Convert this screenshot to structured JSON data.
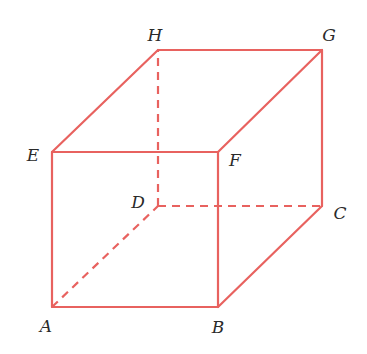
{
  "figure": {
    "type": "cube-wireframe",
    "edge_color": "#e8625f",
    "label_color": "#2a2a2a",
    "vertices": {
      "A": {
        "label": "A",
        "x": 52,
        "y": 307,
        "label_x": 46,
        "label_y": 326
      },
      "B": {
        "label": "B",
        "x": 218,
        "y": 307,
        "label_x": 218,
        "label_y": 327
      },
      "C": {
        "label": "C",
        "x": 322,
        "y": 206,
        "label_x": 340,
        "label_y": 213
      },
      "D": {
        "label": "D",
        "x": 158,
        "y": 206,
        "label_x": 138,
        "label_y": 202
      },
      "E": {
        "label": "E",
        "x": 52,
        "y": 152,
        "label_x": 33,
        "label_y": 155
      },
      "F": {
        "label": "F",
        "x": 218,
        "y": 152,
        "label_x": 235,
        "label_y": 160
      },
      "G": {
        "label": "G",
        "x": 322,
        "y": 50,
        "label_x": 329,
        "label_y": 35
      },
      "H": {
        "label": "H",
        "x": 158,
        "y": 50,
        "label_x": 155,
        "label_y": 35
      }
    },
    "edges": [
      {
        "from": "A",
        "to": "B",
        "style": "solid"
      },
      {
        "from": "B",
        "to": "C",
        "style": "solid"
      },
      {
        "from": "C",
        "to": "G",
        "style": "solid"
      },
      {
        "from": "A",
        "to": "E",
        "style": "solid"
      },
      {
        "from": "B",
        "to": "F",
        "style": "solid"
      },
      {
        "from": "E",
        "to": "F",
        "style": "solid"
      },
      {
        "from": "E",
        "to": "H",
        "style": "solid"
      },
      {
        "from": "F",
        "to": "G",
        "style": "solid"
      },
      {
        "from": "H",
        "to": "G",
        "style": "solid"
      },
      {
        "from": "A",
        "to": "D",
        "style": "dashed"
      },
      {
        "from": "D",
        "to": "C",
        "style": "dashed"
      },
      {
        "from": "D",
        "to": "H",
        "style": "dashed"
      }
    ]
  }
}
